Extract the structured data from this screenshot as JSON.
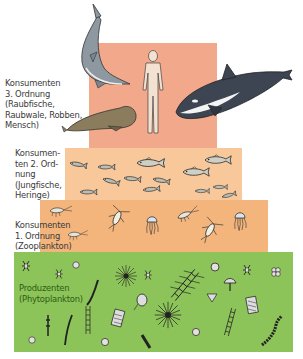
{
  "diagram": {
    "colors": {
      "tier3": "#f2a88a",
      "tier2": "#f8c89a",
      "tier1": "#f3b57c",
      "producers": "#8cc45a",
      "text": "#3a3a3a",
      "producer_text": "#2f5a12"
    },
    "tiers": [
      {
        "id": "konsumenten-3",
        "label_lines": [
          "Konsumenten",
          "3. Ordnung",
          "(Raubfische,",
          "Raubwale, Robben,",
          "Mensch)"
        ],
        "organisms": [
          "shark",
          "human",
          "orca",
          "seal"
        ]
      },
      {
        "id": "konsumenten-2",
        "label_lines": [
          "Konsumen-",
          "ten 2. Ord-",
          "nung",
          "(Jungfische,",
          "Heringe)"
        ],
        "organisms": [
          "fish",
          "herring"
        ]
      },
      {
        "id": "konsumenten-1",
        "label_lines": [
          "Konsumenten",
          "1. Ordnung",
          "(Zooplankton)"
        ],
        "organisms": [
          "shrimp",
          "copepod",
          "jellyfish",
          "krill"
        ]
      },
      {
        "id": "produzenten",
        "label_lines": [
          "Produzenten",
          "(Phytoplankton)"
        ],
        "organisms": [
          "diatom",
          "dinoflagellate",
          "radiolarian",
          "algae-chain"
        ]
      }
    ]
  }
}
